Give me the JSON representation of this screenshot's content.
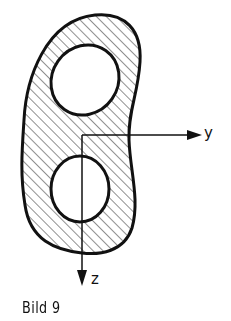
{
  "figure": {
    "caption": "Bild 9",
    "axes": {
      "y_label": "y",
      "z_label": "z"
    },
    "shape": {
      "description": "hatched cross-section with two elliptical holes",
      "hatch_direction": "diagonal"
    },
    "colors": {
      "stroke": "#111111",
      "background": "#ffffff"
    }
  }
}
